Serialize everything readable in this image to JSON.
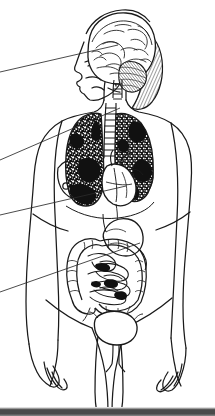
{
  "image": {
    "title": "Female anatomical figure with internal organs",
    "type": "line-drawing",
    "width": 215,
    "height": 416,
    "background_color": "#ffffff",
    "ink_color": "#1a1a1a",
    "style": "scanned black and white pen-and-ink anatomical illustration"
  },
  "figure": {
    "subject": "female human body, anterior view, standing",
    "head_view": "left-facing profile",
    "hair": "diagonally hatched shoulder-length hair"
  },
  "organs": [
    {
      "id": "brain",
      "name": "Brain (cerebrum)",
      "region": "head",
      "shading": "gyri-and-sulci line work"
    },
    {
      "id": "cerebellum",
      "name": "Cerebellum",
      "region": "head",
      "shading": "fine curved hatching"
    },
    {
      "id": "brainstem",
      "name": "Brain stem",
      "region": "neck",
      "shading": "outline"
    },
    {
      "id": "spinal-cord",
      "name": "Spinal cord",
      "region": "neck",
      "shading": "segmented ladder"
    },
    {
      "id": "trachea",
      "name": "Trachea",
      "region": "thorax",
      "shading": "cartilage ring ladder"
    },
    {
      "id": "lung-right",
      "name": "Right lung",
      "region": "thorax",
      "shading": "dense dark stipple"
    },
    {
      "id": "lung-left",
      "name": "Left lung",
      "region": "thorax",
      "shading": "dense dark stipple"
    },
    {
      "id": "heart",
      "name": "Heart",
      "region": "thorax",
      "shading": "outline with vessels"
    },
    {
      "id": "stomach",
      "name": "Stomach",
      "region": "abdomen",
      "shading": "outline"
    },
    {
      "id": "large-intestine",
      "name": "Large intestine",
      "region": "abdomen",
      "shading": "scalloped haustra"
    },
    {
      "id": "small-intestine",
      "name": "Small intestine",
      "region": "abdomen",
      "shading": "coiled loops"
    },
    {
      "id": "bladder",
      "name": "Urinary bladder",
      "region": "pelvis",
      "shading": "outline oval"
    },
    {
      "id": "urethra",
      "name": "Urethra",
      "region": "pelvis",
      "shading": "outline"
    }
  ],
  "leader_lines": [
    {
      "id": "leader-brain",
      "target": "brain",
      "edge_y": 72,
      "tip_x": 118,
      "tip_y": 45
    },
    {
      "id": "leader-lungs",
      "target": "lungs",
      "edge_y": 160,
      "tip_x": 120,
      "tip_y": 108
    },
    {
      "id": "leader-heart",
      "target": "heart",
      "edge_y": 215,
      "tip_x": 126,
      "tip_y": 186
    },
    {
      "id": "leader-intestine",
      "target": "large-intestine",
      "edge_y": 292,
      "tip_x": 140,
      "tip_y": 243
    }
  ],
  "footer": {
    "band_color": "#4a4a4a"
  }
}
